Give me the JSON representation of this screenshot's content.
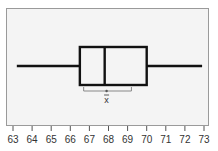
{
  "chart_data": {
    "type": "boxplot",
    "title": "",
    "xlabel": "",
    "ylabel": "",
    "orientation": "horizontal",
    "xlim": [
      63,
      73
    ],
    "ticks": [
      63,
      64,
      65,
      66,
      67,
      68,
      69,
      70,
      71,
      72,
      73
    ],
    "tick_labels": [
      "63",
      "64",
      "65",
      "66",
      "67",
      "68",
      "69",
      "70",
      "71",
      "72",
      "73"
    ],
    "grid": false,
    "box": {
      "whisker_min": 63.2,
      "q1": 66.5,
      "median": 67.8,
      "q3": 70.0,
      "whisker_max": 72.9
    },
    "mean": 67.9,
    "mean_confidence_interval": [
      66.7,
      69.2
    ],
    "annotations": [
      {
        "text": "x̄",
        "meaning": "sample mean marker"
      }
    ]
  },
  "style": {
    "plot_background": "#f4f4f4",
    "frame_color": "#9a9a9a",
    "box_color": "#111111",
    "ci_color": "#888888"
  }
}
